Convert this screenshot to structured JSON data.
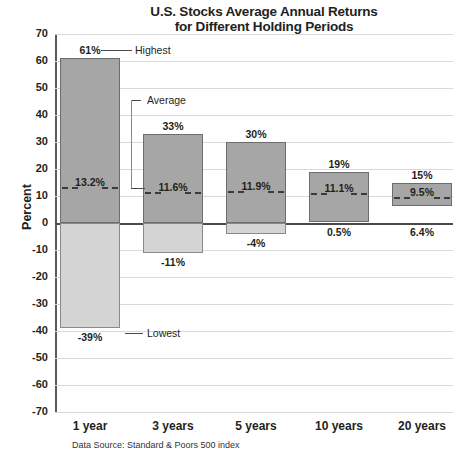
{
  "chart_data": {
    "type": "bar",
    "title": "U.S. Stocks Average Annual Returns for Different Holding Periods",
    "title_line1": "U.S. Stocks Average Annual Returns",
    "title_line2": "for Different Holding Periods",
    "xlabel": "",
    "ylabel": "Percent",
    "ylim": [
      -70,
      70
    ],
    "yticks": [
      70,
      60,
      50,
      40,
      30,
      20,
      10,
      0,
      -10,
      -20,
      -30,
      -40,
      -50,
      -60,
      -70
    ],
    "ytick_labels": [
      "70",
      "60",
      "50",
      "40",
      "30",
      "20",
      "10",
      "0",
      "-10",
      "-20",
      "-30",
      "-40",
      "-50",
      "-60",
      "-70"
    ],
    "grid": true,
    "legend": "none",
    "categories": [
      "1 year",
      "3 years",
      "5 years",
      "10 years",
      "20 years"
    ],
    "series": [
      {
        "name": "Highest",
        "values": [
          61,
          33,
          30,
          19,
          15
        ],
        "labels": [
          "61%",
          "33%",
          "30%",
          "19%",
          "15%"
        ]
      },
      {
        "name": "Average",
        "values": [
          13.2,
          11.6,
          11.9,
          11.1,
          9.5
        ],
        "labels": [
          "13.2%",
          "11.6%",
          "11.9%",
          "11.1%",
          "9.5%"
        ]
      },
      {
        "name": "Lowest",
        "values": [
          -39,
          -11,
          -4,
          0.5,
          6.4
        ],
        "labels": [
          "-39%",
          "-11%",
          "-4%",
          "0.5%",
          "6.4%"
        ]
      }
    ],
    "annotations": [
      {
        "text": "Highest",
        "anchor": "1 year"
      },
      {
        "text": "Average",
        "anchor": "1 year"
      },
      {
        "text": "Lowest",
        "anchor": "1 year"
      }
    ],
    "source": "Data Source: Standard & Poors 500 index",
    "colors": {
      "bar_positive": "#a6a6a6",
      "bar_negative": "#d4d4d4",
      "bar_border": "#6d6d6d",
      "gridline": "#d9d9d9",
      "axis": "#4a4a4a",
      "text": "#231f20",
      "background": "#ffffff"
    }
  },
  "chart": {
    "title_line1": "U.S. Stocks Average Annual Returns",
    "title_line2": "for Different Holding Periods",
    "ylabel": "Percent",
    "source": "Data Source: Standard & Poors 500 index",
    "anno_highest": "Highest",
    "anno_average": "Average",
    "anno_lowest": "Lowest",
    "yticks": [
      "70",
      "60",
      "50",
      "40",
      "30",
      "20",
      "10",
      "0",
      "-10",
      "-20",
      "-30",
      "-40",
      "-50",
      "-60",
      "-70"
    ],
    "categories": [
      "1 year",
      "3 years",
      "5 years",
      "10 years",
      "20 years"
    ],
    "high_labels": [
      "61%",
      "33%",
      "30%",
      "19%",
      "15%"
    ],
    "avg_labels": [
      "13.2%",
      "11.6%",
      "11.9%",
      "11.1%",
      "9.5%"
    ],
    "low_labels": [
      "-39%",
      "-11%",
      "-4%",
      "0.5%",
      "6.4%"
    ],
    "edge_fragment": ""
  }
}
